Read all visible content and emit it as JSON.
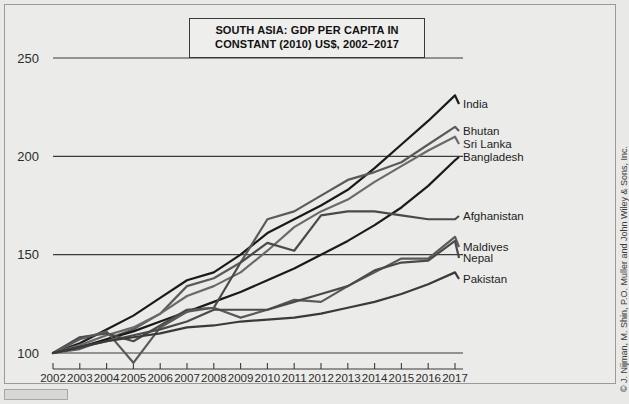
{
  "figure": {
    "title_lines": [
      "SOUTH ASIA: GDP PER CAPITA IN",
      "CONSTANT (2010) US$, 2002–2017"
    ],
    "credit": "© J. Nijman, M. Shin, P.O. Muller and John Wiley & Sons, Inc."
  },
  "chart_data": {
    "type": "line",
    "title": "SOUTH ASIA: GDP PER CAPITA IN CONSTANT (2010) US$, 2002–2017",
    "xlabel": "",
    "ylabel": "",
    "xlim": [
      2002,
      2017
    ],
    "ylim": [
      90,
      255
    ],
    "yticks": [
      100,
      150,
      200,
      250
    ],
    "grid": "horizontal",
    "legend": "right-inline-labels",
    "note": "Index, 2002 = 100",
    "x": [
      2002,
      2003,
      2004,
      2005,
      2006,
      2007,
      2008,
      2009,
      2010,
      2011,
      2012,
      2013,
      2014,
      2015,
      2016,
      2017
    ],
    "categories": [
      "2002",
      "2003",
      "2004",
      "2005",
      "2006",
      "2007",
      "2008",
      "2009",
      "2010",
      "2011",
      "2012",
      "2013",
      "2014",
      "2015",
      "2016",
      "2017"
    ],
    "series": [
      {
        "name": "India",
        "color": "#1a1a1a",
        "width": 2.2,
        "values": [
          100,
          105,
          112,
          119,
          128,
          137,
          141,
          150,
          161,
          168,
          175,
          183,
          194,
          206,
          218,
          231
        ]
      },
      {
        "name": "Bhutan",
        "color": "#5a5a5a",
        "width": 2.2,
        "values": [
          100,
          102,
          107,
          112,
          120,
          134,
          138,
          146,
          168,
          172,
          180,
          188,
          192,
          197,
          206,
          215
        ]
      },
      {
        "name": "Sri Lanka",
        "color": "#6a6a6a",
        "width": 2.2,
        "values": [
          100,
          104,
          109,
          113,
          120,
          129,
          134,
          141,
          152,
          164,
          172,
          178,
          187,
          195,
          203,
          210
        ]
      },
      {
        "name": "Bangladesh",
        "color": "#1a1a1a",
        "width": 2.2,
        "values": [
          100,
          103,
          107,
          111,
          116,
          121,
          126,
          131,
          137,
          143,
          150,
          157,
          165,
          174,
          185,
          198
        ]
      },
      {
        "name": "Afghanistan",
        "color": "#4a4a4a",
        "width": 2.2,
        "values": [
          100,
          108,
          110,
          106,
          114,
          122,
          123,
          146,
          156,
          152,
          170,
          172,
          172,
          170,
          168,
          168
        ]
      },
      {
        "name": "Maldives",
        "color": "#5a5a5a",
        "width": 2.2,
        "values": [
          100,
          107,
          111,
          95,
          113,
          121,
          123,
          118,
          122,
          127,
          126,
          134,
          141,
          148,
          148,
          159
        ]
      },
      {
        "name": "Nepal",
        "color": "#4a4a4a",
        "width": 2.2,
        "values": [
          100,
          103,
          106,
          109,
          112,
          116,
          122,
          122,
          122,
          126,
          130,
          134,
          142,
          146,
          147,
          157
        ]
      },
      {
        "name": "Pakistan",
        "color": "#3a3a3a",
        "width": 2.2,
        "values": [
          100,
          103,
          106,
          108,
          110,
          113,
          114,
          116,
          117,
          118,
          120,
          123,
          126,
          130,
          135,
          141
        ]
      }
    ],
    "label_positions": [
      {
        "name": "India",
        "y_px": 99
      },
      {
        "name": "Bhutan",
        "y_px": 126
      },
      {
        "name": "Sri Lanka",
        "y_px": 139
      },
      {
        "name": "Bangladesh",
        "y_px": 152
      },
      {
        "name": "Afghanistan",
        "y_px": 211
      },
      {
        "name": "Maldives",
        "y_px": 242
      },
      {
        "name": "Nepal",
        "y_px": 253
      },
      {
        "name": "Pakistan",
        "y_px": 274
      }
    ]
  }
}
